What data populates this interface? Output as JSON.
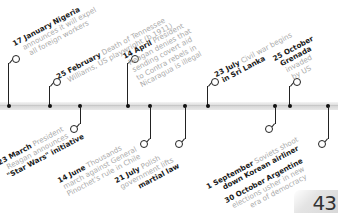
{
  "timeline": {
    "events": [
      {
        "date": "17 January",
        "bold_lead": "Nigeria",
        "text_lines": [
          "announces it will expel",
          "all foreign workers"
        ],
        "side": "above"
      },
      {
        "date": "25 February",
        "text_lines": [
          "Death of Tennessee",
          "Williams, US playwright (b.1911)"
        ],
        "side": "above"
      },
      {
        "date": "23 March",
        "text_lines": [
          "President",
          "Reagan announces",
          "\"Star Wars\" initiative"
        ],
        "side": "below"
      },
      {
        "date": "14 April",
        "text_lines": [
          "President",
          "Reagan denies that",
          "sending covert aid",
          "to Contra rebels in",
          "Nicaragua is illegal"
        ],
        "side": "above"
      },
      {
        "date": "14 June",
        "text_lines": [
          "Thousands",
          "march against General",
          "Pinochet's rule in Chile"
        ],
        "side": "below"
      },
      {
        "date": "21 July",
        "text_lines": [
          "Polish",
          "government lifts",
          "martial law"
        ],
        "side": "below"
      },
      {
        "date": "23 July",
        "text_lines": [
          "Civil war begins",
          "in Sri Lanka"
        ],
        "side": "above"
      },
      {
        "date": "1 September",
        "text_lines": [
          "Soviets shoot",
          "down Korean airliner"
        ],
        "side": "below"
      },
      {
        "date": "25 October",
        "text_lines": [
          "Grenada",
          "invaded",
          "by US"
        ],
        "side": "above"
      },
      {
        "date": "30 October",
        "text_lines": [
          "Argentine",
          "elections usher in new",
          "era of democracy"
        ],
        "side": "below"
      }
    ]
  },
  "page": {
    "number": "43"
  },
  "colors": {
    "bold_text": "#1a1a1a",
    "light_text": "#aaaaaa",
    "bar": "#dcdcdc",
    "line": "#222222"
  }
}
